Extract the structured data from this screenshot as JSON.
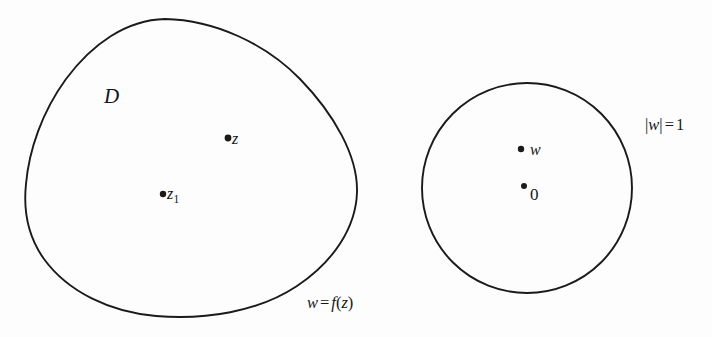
{
  "figure": {
    "background_color": "#fdfdfd",
    "stroke_color": "#1a1a1a",
    "text_color": "#161616"
  },
  "left_region": {
    "shape_name": "simply-connected-domain-blob",
    "domain_label": "D",
    "points": [
      {
        "name": "z",
        "label": "z",
        "x": 228,
        "y": 138
      },
      {
        "name": "z1",
        "base": "z",
        "subscript": "1",
        "label": "z₁",
        "x": 163,
        "y": 194
      }
    ],
    "boundary_label": {
      "full": "w = f(z)",
      "lhs": "w",
      "operator": "=",
      "rhs_function": "f",
      "rhs_argument": "z",
      "open_paren": "(",
      "close_paren": ")"
    }
  },
  "right_region": {
    "shape_name": "unit-disk-circle",
    "center": {
      "x": 527,
      "y": 188
    },
    "radius": 105,
    "points": [
      {
        "name": "w",
        "label": "w",
        "x": 521,
        "y": 149
      },
      {
        "name": "origin",
        "label": "0",
        "x": 524,
        "y": 188
      }
    ],
    "boundary_label": {
      "full": "|w| = 1",
      "left_bar": "|",
      "variable": "w",
      "right_bar": "|",
      "operator": "=",
      "value": "1"
    }
  }
}
